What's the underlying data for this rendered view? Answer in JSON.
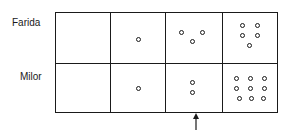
{
  "rows": [
    {
      "label": "Farida",
      "cells": [
        {
          "count": 0,
          "dots": []
        },
        {
          "count": 1,
          "dots": [
            [
              28,
              26
            ]
          ]
        },
        {
          "count": 3,
          "dots": [
            [
              16,
              19
            ],
            [
              37,
              19
            ],
            [
              27,
              28
            ]
          ]
        },
        {
          "count": 5,
          "dots": [
            [
              20,
              12
            ],
            [
              35,
              12
            ],
            [
              20,
              22
            ],
            [
              35,
              22
            ],
            [
              27,
              32
            ]
          ]
        }
      ]
    },
    {
      "label": "Milor",
      "cells": [
        {
          "count": 0,
          "dots": []
        },
        {
          "count": 1,
          "dots": [
            [
              28,
              25
            ]
          ]
        },
        {
          "count": 2,
          "dots": [
            [
              27,
              19
            ],
            [
              27,
              29
            ]
          ]
        },
        {
          "count": 9,
          "dots": [
            [
              14,
              15
            ],
            [
              28,
              15
            ],
            [
              42,
              15
            ],
            [
              14,
              25
            ],
            [
              28,
              25
            ],
            [
              42,
              25
            ],
            [
              17,
              35
            ],
            [
              29,
              35
            ],
            [
              41,
              35
            ]
          ]
        }
      ]
    }
  ],
  "arrow": {
    "direction": "up",
    "under_column": 3
  }
}
